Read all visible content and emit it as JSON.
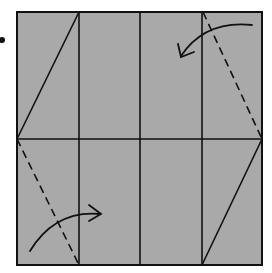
{
  "diagram": {
    "type": "origami-fold-diagram",
    "paper_fill": "#a9a9a9",
    "line_color": "#111111",
    "square": {
      "x": 17,
      "y": 12,
      "width": 245,
      "height": 253
    },
    "bullet": {
      "cx": 2,
      "cy": 40,
      "r": 3
    },
    "crease_lines": [
      {
        "id": "vertical-1",
        "x1": 79,
        "y1": 12,
        "x2": 79,
        "y2": 265,
        "style": "solid"
      },
      {
        "id": "vertical-2",
        "x1": 140,
        "y1": 12,
        "x2": 140,
        "y2": 265,
        "style": "solid"
      },
      {
        "id": "vertical-3",
        "x1": 202,
        "y1": 12,
        "x2": 202,
        "y2": 265,
        "style": "solid"
      },
      {
        "id": "horizontal-mid",
        "x1": 17,
        "y1": 139,
        "x2": 262,
        "y2": 139,
        "style": "solid"
      },
      {
        "id": "diag-top-left",
        "x1": 79,
        "y1": 12,
        "x2": 17,
        "y2": 139,
        "style": "solid"
      },
      {
        "id": "diag-bottom-right",
        "x1": 262,
        "y1": 139,
        "x2": 202,
        "y2": 265,
        "style": "solid"
      },
      {
        "id": "diag-top-right-valley",
        "x1": 203,
        "y1": 12,
        "x2": 262,
        "y2": 139,
        "style": "dashed"
      },
      {
        "id": "diag-bottom-left-valley",
        "x1": 17,
        "y1": 139,
        "x2": 79,
        "y2": 265,
        "style": "dashed"
      }
    ],
    "arrows": [
      {
        "id": "arrow-top-right",
        "path": "M252,25 Q205,20 181,56",
        "head": "181,56",
        "direction": "fold-left"
      },
      {
        "id": "arrow-bottom-left",
        "path": "M30,251 Q55,210 100,214",
        "head": "100,214",
        "direction": "fold-right"
      }
    ]
  }
}
